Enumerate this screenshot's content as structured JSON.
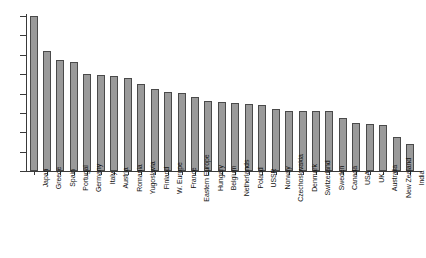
{
  "chart_data": {
    "type": "bar",
    "title": "",
    "subtitle": "",
    "xlabel": "",
    "ylabel": "",
    "ylim": [
      0,
      8
    ],
    "yticks": [
      0,
      1,
      2,
      3,
      4,
      5,
      6,
      7,
      8
    ],
    "ytick_labels": [
      "0",
      "1",
      "2",
      "3",
      "4",
      "5",
      "6",
      "7",
      "8"
    ],
    "grid": false,
    "legend": null,
    "bar_color": "#9a9a9a",
    "bar_edge_color": "#4a4a4a",
    "axis_color": "#3a3a3a",
    "background": "#ffffff",
    "categories": [
      "Japan",
      "Greece",
      "Spain",
      "Portugal",
      "Germany",
      "Italy",
      "Austria",
      "Romania",
      "Yugoslavia",
      "Finland",
      "W. Europe",
      "France",
      "Eastern Europe",
      "Hungary",
      "Belgium",
      "Netherlands",
      "Poland",
      "USSR",
      "Norway",
      "Czechoslovakia",
      "Denmark",
      "Switzerland",
      "Sweden",
      "Canada",
      "USA",
      "UK",
      "Australia",
      "New Zealand",
      "India"
    ],
    "values": [
      8.0,
      6.2,
      5.75,
      5.65,
      5.0,
      4.95,
      4.9,
      4.8,
      4.5,
      4.25,
      4.1,
      4.05,
      3.8,
      3.6,
      3.55,
      3.5,
      3.45,
      3.4,
      3.2,
      3.1,
      3.1,
      3.1,
      3.1,
      2.75,
      2.5,
      2.45,
      2.35,
      1.75,
      1.4
    ]
  }
}
